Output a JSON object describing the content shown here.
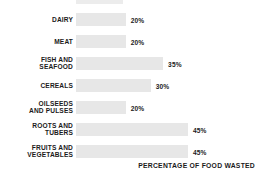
{
  "chart_data": {
    "type": "bar",
    "orientation": "horizontal",
    "title": "",
    "xlabel": "PERCENTAGE OF FOOD WASTED",
    "ylabel": "",
    "xlim": [
      0,
      50
    ],
    "grid": false,
    "legend": null,
    "categories": [
      "DAIRY",
      "MEAT",
      "FISH AND\nSEAFOOD",
      "CEREALS",
      "OILSEEDS\nAND PULSES",
      "ROOTS AND\nTUBERS",
      "FRUITS AND\nVEGETABLES"
    ],
    "values": [
      20,
      20,
      35,
      30,
      20,
      45,
      45
    ],
    "value_labels": [
      "20%",
      "20%",
      "35%",
      "30%",
      "20%",
      "45%",
      "45%"
    ],
    "bar_color": "#e7e7e7",
    "text_color": "#1b1b1b",
    "background": "#ffffff"
  },
  "axis": {
    "caption": "PERCENTAGE OF FOOD WASTED"
  }
}
